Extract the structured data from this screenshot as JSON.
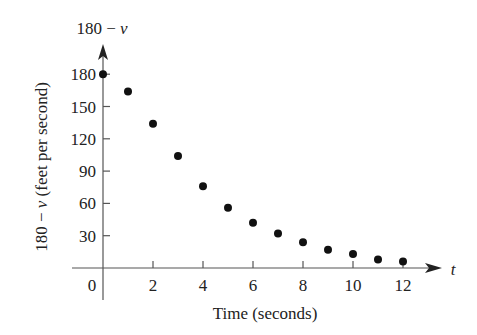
{
  "chart_data": {
    "type": "scatter",
    "title": "",
    "xlabel": "Time (seconds)",
    "ylabel": "180 − v (feet per second)",
    "y_axis_top_label": "180 − v",
    "x_axis_end_label": "t",
    "x_ticks": [
      0,
      2,
      4,
      6,
      8,
      10,
      12
    ],
    "y_ticks": [
      30,
      60,
      90,
      120,
      150,
      180
    ],
    "xlim": [
      0,
      13.5
    ],
    "ylim": [
      0,
      200
    ],
    "grid": false,
    "legend": null,
    "x": [
      0,
      1,
      2,
      3,
      4,
      5,
      6,
      7,
      8,
      9,
      10,
      11,
      12
    ],
    "y": [
      180,
      164,
      134,
      104,
      76,
      56,
      42,
      32,
      24,
      17,
      13,
      8,
      6
    ]
  },
  "labels": {
    "xlabel": "Time (seconds)",
    "ylabel": "180 − v (feet per second)",
    "y_top": "180 − v",
    "x_end": "t",
    "origin": "0"
  },
  "colors": {
    "axis": "#555555",
    "points": "#111111",
    "text": "#222222"
  }
}
